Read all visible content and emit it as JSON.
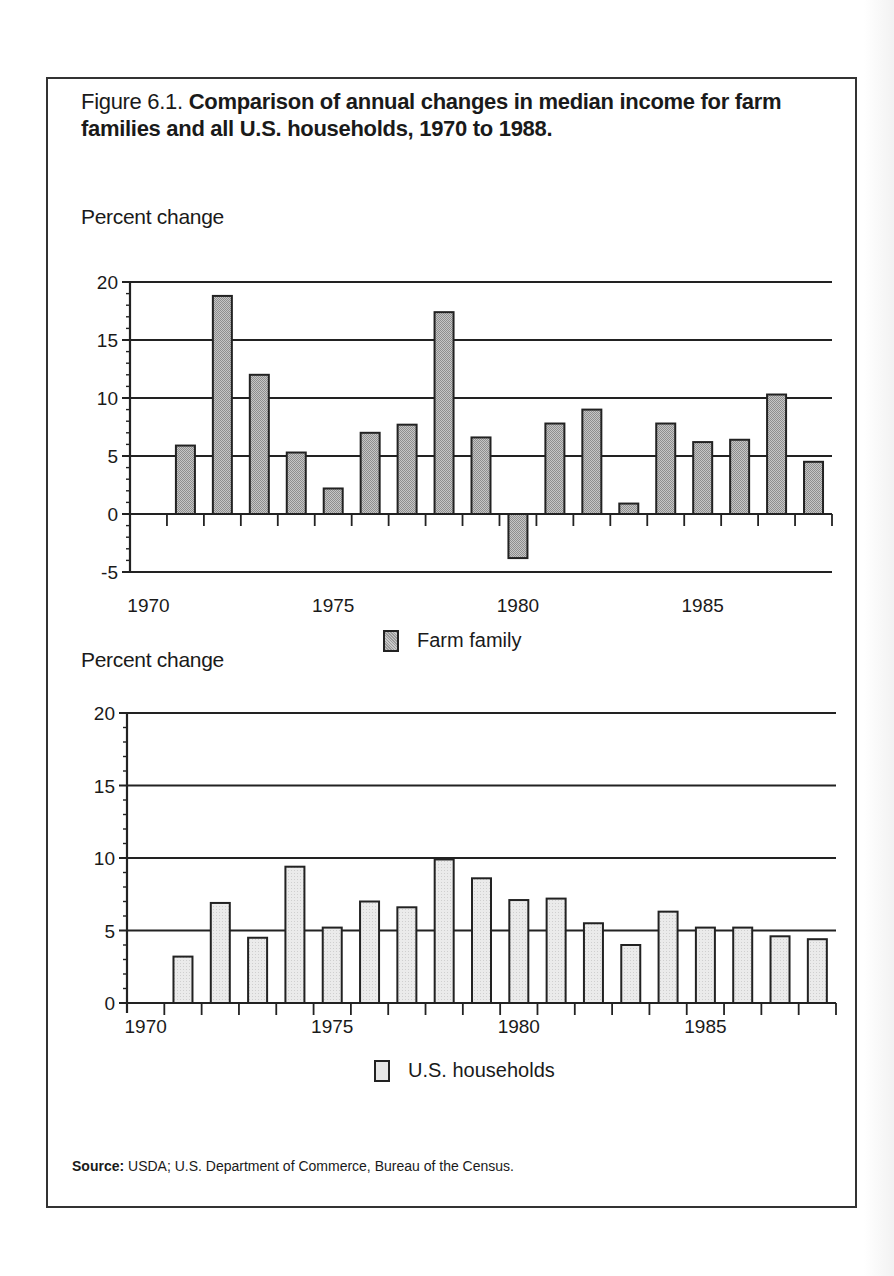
{
  "figure": {
    "number": "Figure 6.1.",
    "title": "Comparison of annual changes in median income for farm families and all U.S. households, 1970 to 1988."
  },
  "top_chart": {
    "ylabel": "Percent change",
    "legend": "Farm family"
  },
  "bottom_chart": {
    "ylabel": "Percent change",
    "legend": "U.S. households"
  },
  "source": {
    "label": "Source:",
    "text": "USDA; U.S. Department of Commerce, Bureau of the Census."
  },
  "colors": {
    "farm_fill": "#b4b4b4",
    "us_fill": "#e4e4e4",
    "line": "#222222"
  },
  "chart_data": [
    {
      "type": "bar",
      "title": "Farm family",
      "xlabel": "",
      "ylabel": "Percent change",
      "x_tick_labels": [
        "1970",
        "1975",
        "1980",
        "1985"
      ],
      "y_ticks": [
        -5,
        0,
        5,
        10,
        15,
        20
      ],
      "ylim": [
        -5,
        20
      ],
      "xlim": [
        1970,
        1988
      ],
      "grid": true,
      "legend_position": "bottom",
      "categories": [
        1971,
        1972,
        1973,
        1974,
        1975,
        1976,
        1977,
        1978,
        1979,
        1980,
        1981,
        1982,
        1983,
        1984,
        1985,
        1986,
        1987,
        1988
      ],
      "values": [
        5.9,
        18.8,
        12.0,
        5.3,
        2.2,
        7.0,
        7.7,
        17.4,
        6.6,
        -3.8,
        7.8,
        9.0,
        0.9,
        7.8,
        6.2,
        6.4,
        10.3,
        4.5
      ]
    },
    {
      "type": "bar",
      "title": "U.S. households",
      "xlabel": "",
      "ylabel": "Percent change",
      "x_tick_labels": [
        "1970",
        "1975",
        "1980",
        "1985"
      ],
      "y_ticks": [
        0,
        5,
        10,
        15,
        20
      ],
      "ylim": [
        0,
        20
      ],
      "xlim": [
        1970,
        1988
      ],
      "grid": true,
      "legend_position": "bottom",
      "categories": [
        1971,
        1972,
        1973,
        1974,
        1975,
        1976,
        1977,
        1978,
        1979,
        1980,
        1981,
        1982,
        1983,
        1984,
        1985,
        1986,
        1987,
        1988
      ],
      "values": [
        3.2,
        6.9,
        4.5,
        9.4,
        5.2,
        7.0,
        6.6,
        9.9,
        8.6,
        7.1,
        7.2,
        5.5,
        4.0,
        6.3,
        5.2,
        5.2,
        4.6,
        4.4
      ]
    }
  ]
}
